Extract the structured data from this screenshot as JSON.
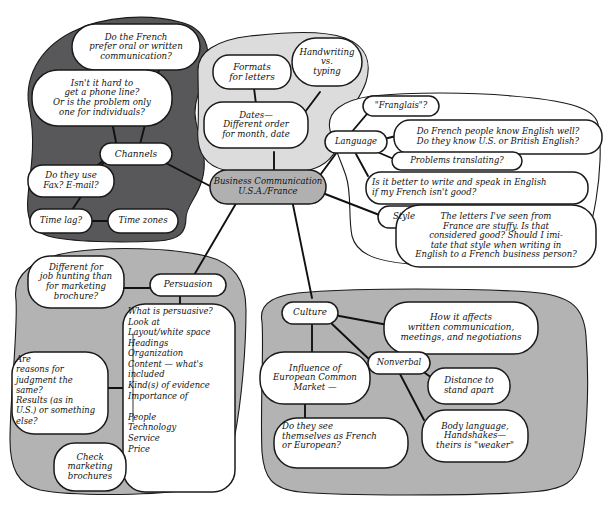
{
  "colors": {
    "dark_region": "#58585a",
    "mid_region": "#b3b3b3",
    "light_region": "#dcdcdc",
    "center_node_fill": "#b0b0b0",
    "node_fill": "#ffffff",
    "stroke": "#1a1a1a",
    "background": "#ffffff"
  },
  "center": {
    "label": "Business Communication\nU.S.A./France"
  },
  "regions": [
    {
      "name": "channels-region",
      "shade": "dark"
    },
    {
      "name": "formats-region",
      "shade": "light"
    },
    {
      "name": "language-style-region",
      "shade": "white"
    },
    {
      "name": "persuasion-region",
      "shade": "mid"
    },
    {
      "name": "culture-region",
      "shade": "mid"
    }
  ],
  "branches": [
    {
      "key": "channels",
      "label": "Channels",
      "children": [
        {
          "key": "oral-written",
          "label": "Do the French\nprefer oral or written\ncommunication?"
        },
        {
          "key": "phone-line",
          "label": "Isn't it hard to\nget a phone line?\nOr is the problem only\none for individuals?"
        },
        {
          "key": "fax-email",
          "label": "Do they use\nFax? E-mail?"
        },
        {
          "key": "time-lag",
          "label": "Time lag?"
        },
        {
          "key": "time-zones",
          "label": "Time zones"
        }
      ]
    },
    {
      "key": "formats",
      "label": "Formats\nfor letters",
      "children": [
        {
          "key": "dates",
          "label": "Dates—\nDifferent order\nfor month, date"
        },
        {
          "key": "handwriting",
          "label": "Handwriting\nvs.\ntyping"
        }
      ]
    },
    {
      "key": "language",
      "label": "Language",
      "children": [
        {
          "key": "franglais",
          "label": "\"Franglais\"?"
        },
        {
          "key": "know-english",
          "label": "Do French people know English well?\nDo they know U.S. or British English?"
        },
        {
          "key": "problems-translating",
          "label": "Problems translating?"
        },
        {
          "key": "better-english",
          "label": "Is it better to write and speak in English\nif my French isn't good?"
        }
      ]
    },
    {
      "key": "style",
      "label": "Style",
      "children": [
        {
          "key": "stuffy-letters",
          "label": "The letters I've seen from\nFrance are stuffy. Is that\nconsidered good? Should I imi-\ntate that style when writing in\nEnglish to a French business person?"
        }
      ]
    },
    {
      "key": "persuasion",
      "label": "Persuasion",
      "children": [
        {
          "key": "job-hunting",
          "label": "Different for\njob hunting than\nfor marketing\nbrochure?"
        },
        {
          "key": "what-is-persuasive",
          "label": "What is persuasive?\nLook at\n Layout/white space\n Headings\n Organization\n Content — what's\n included\n Kind(s) of evidence\n Importance of\n\n    People\n    Technology\n    Service\n    Price"
        },
        {
          "key": "reasons-judgment",
          "label": "Are\nreasons for\njudgment the\nsame?\nResults (as in\nU.S.) or something\nelse?"
        },
        {
          "key": "check-brochures",
          "label": "Check\nmarketing\nbrochures"
        }
      ]
    },
    {
      "key": "culture",
      "label": "Culture",
      "children": [
        {
          "key": "how-it-affects",
          "label": "How it affects\nwritten communication,\nmeetings, and negotiations"
        },
        {
          "key": "european-common-market",
          "label": "Influence of\nEuropean Common\nMarket —"
        },
        {
          "key": "french-or-european",
          "label": "Do they see\nthemselves as French\nor European?"
        },
        {
          "key": "nonverbal",
          "label": "Nonverbal"
        },
        {
          "key": "distance",
          "label": "Distance to\nstand apart"
        },
        {
          "key": "body-language",
          "label": "Body language,\nHandshakes—\ntheirs is \"weaker\""
        }
      ]
    }
  ]
}
